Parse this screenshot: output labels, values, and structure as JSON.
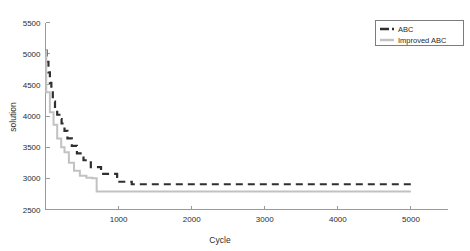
{
  "chart_data": {
    "type": "line",
    "title": "",
    "xlabel": "Cycle",
    "ylabel": "solution",
    "xlim": [
      0,
      5500
    ],
    "ylim": [
      2500,
      5500
    ],
    "xticks": [
      1000,
      2000,
      3000,
      4000,
      5000
    ],
    "xtick_labels": [
      "1000",
      "2000",
      "3000",
      "4000",
      "5000"
    ],
    "yticks": [
      2500,
      3000,
      3500,
      4000,
      4500,
      5000,
      5500
    ],
    "ytick_labels": [
      "2500",
      "3000",
      "3500",
      "4000",
      "4500",
      "5000",
      "5500"
    ],
    "grid": false,
    "legend_position": "top-right",
    "series": [
      {
        "name": "ABC",
        "color": "#2f2f2f",
        "style": "dashed",
        "width": 2.2,
        "x": [
          0,
          15,
          15,
          40,
          40,
          60,
          60,
          80,
          80,
          100,
          100,
          130,
          130,
          160,
          160,
          190,
          190,
          220,
          220,
          260,
          260,
          300,
          300,
          360,
          360,
          430,
          430,
          520,
          520,
          620,
          620,
          760,
          760,
          980,
          980,
          1180,
          1180,
          5000
        ],
        "y": [
          5050,
          5050,
          4870,
          4870,
          4700,
          4700,
          4530,
          4530,
          4380,
          4380,
          4230,
          4230,
          4100,
          4100,
          4020,
          4020,
          3950,
          3950,
          3880,
          3880,
          3760,
          3760,
          3640,
          3640,
          3520,
          3520,
          3400,
          3400,
          3290,
          3290,
          3180,
          3180,
          3070,
          3070,
          2945,
          2945,
          2905,
          2905
        ]
      },
      {
        "name": "Improved ABC",
        "color": "#c2c2c2",
        "style": "solid",
        "width": 2.0,
        "x": [
          0,
          10,
          10,
          60,
          60,
          110,
          110,
          160,
          160,
          215,
          215,
          260,
          260,
          320,
          320,
          390,
          390,
          470,
          470,
          560,
          560,
          640,
          640,
          700,
          700,
          5000
        ],
        "y": [
          5050,
          5050,
          4380,
          4380,
          4060,
          4060,
          3860,
          3860,
          3640,
          3640,
          3500,
          3500,
          3420,
          3420,
          3250,
          3250,
          3120,
          3120,
          3040,
          3040,
          3010,
          3010,
          3000,
          3000,
          2790,
          2790
        ]
      }
    ],
    "legend": [
      {
        "label": "ABC",
        "color": "#2f2f2f",
        "style": "dashed"
      },
      {
        "label": "Improved ABC",
        "color": "#c2c2c2",
        "style": "solid"
      }
    ]
  }
}
